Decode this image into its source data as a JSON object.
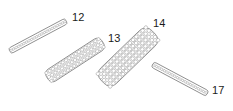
{
  "figure": {
    "background_color": "#ffffff",
    "line_color": "#6f6f6f",
    "cell_line_color": "#8a8a8a",
    "label_color": "#1b1b1b",
    "width": 233,
    "height": 111
  },
  "strips": [
    {
      "ref": "12",
      "description": "single-row chain strip, upper left, ascending to the right",
      "rows": 1,
      "columns": 22,
      "angle_deg": -28,
      "length_px": 64,
      "width_px": 6,
      "center_x": 38,
      "center_y": 36,
      "label": {
        "text": "12",
        "x": 72,
        "y": 12
      }
    },
    {
      "ref": "13",
      "description": "three-row mesh band, middle left, ascending to the right",
      "rows": 3,
      "columns": 17,
      "angle_deg": -33,
      "length_px": 66,
      "width_px": 14,
      "center_x": 75,
      "center_y": 60,
      "label": {
        "text": "13",
        "x": 108,
        "y": 33
      }
    },
    {
      "ref": "14",
      "description": "five-row mesh band, center, steeply ascending to the right",
      "rows": 5,
      "columns": 16,
      "angle_deg": -44,
      "length_px": 71,
      "width_px": 22,
      "center_x": 128,
      "center_y": 57,
      "label": {
        "text": "14",
        "x": 153,
        "y": 18
      }
    },
    {
      "ref": "17",
      "description": "single-row chain strip, lower right, descending to the right",
      "rows": 1,
      "columns": 21,
      "angle_deg": 28,
      "length_px": 62,
      "width_px": 6,
      "center_x": 180,
      "center_y": 79,
      "label": {
        "text": "17",
        "x": 212,
        "y": 85
      }
    }
  ]
}
